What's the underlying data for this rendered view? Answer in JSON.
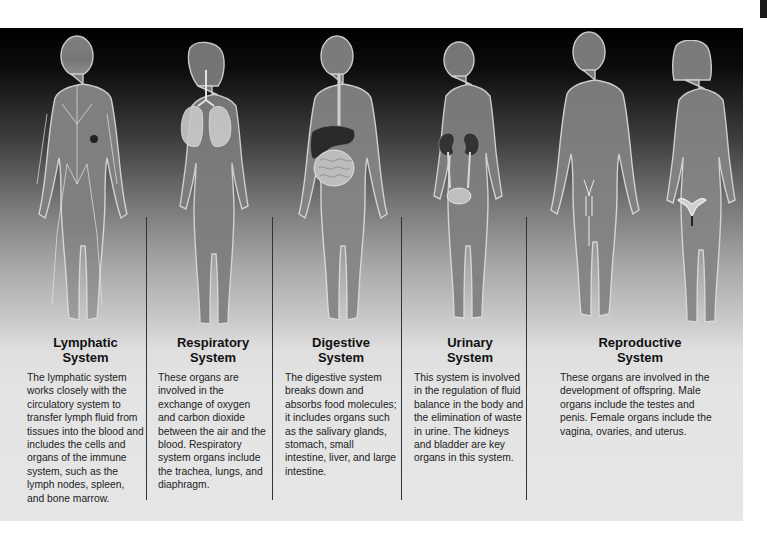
{
  "systems": [
    {
      "title_line1": "Lymphatic",
      "title_line2": "System",
      "description": "The lymphatic system works closely with the circulatory system to transfer lymph fluid from tissues into the blood and includes the cells and organs of the immune system, such as the lymph nodes, spleen, and bone marrow.",
      "figure": "male figure with lymph vessels and nodes"
    },
    {
      "title_line1": "Respiratory",
      "title_line2": "System",
      "description": "These organs are involved in the exchange of oxygen and carbon dioxide between the air and the blood. Respiratory system organs include the trachea, lungs, and diaphragm.",
      "figure": "female figure with trachea and lungs"
    },
    {
      "title_line1": "Digestive",
      "title_line2": "System",
      "description": "The digestive system breaks down and absorbs food molecules; it includes organs such as the salivary glands, stomach, small intestine, liver, and large intestine.",
      "figure": "male figure with esophagus, liver, stomach and intestines"
    },
    {
      "title_line1": "Urinary",
      "title_line2": "System",
      "description": "This system is involved in the regulation of fluid balance in the body and the elimination of waste in urine. The kidneys and bladder are key organs in this system.",
      "figure": "female figure with kidneys, ureters and bladder"
    },
    {
      "title_line1": "Reproductive",
      "title_line2": "System",
      "description": "These organs are involved in the development of offspring. Male organs include the testes and penis. Female organs include the vagina, ovaries, and uterus.",
      "figure": "male and female figures with reproductive organs"
    }
  ],
  "colors": {
    "background_top": "#000000",
    "background_bottom": "#e6e6e6",
    "figure_glow": "#d8d8d8",
    "divider": "#333333",
    "text": "#222222"
  }
}
